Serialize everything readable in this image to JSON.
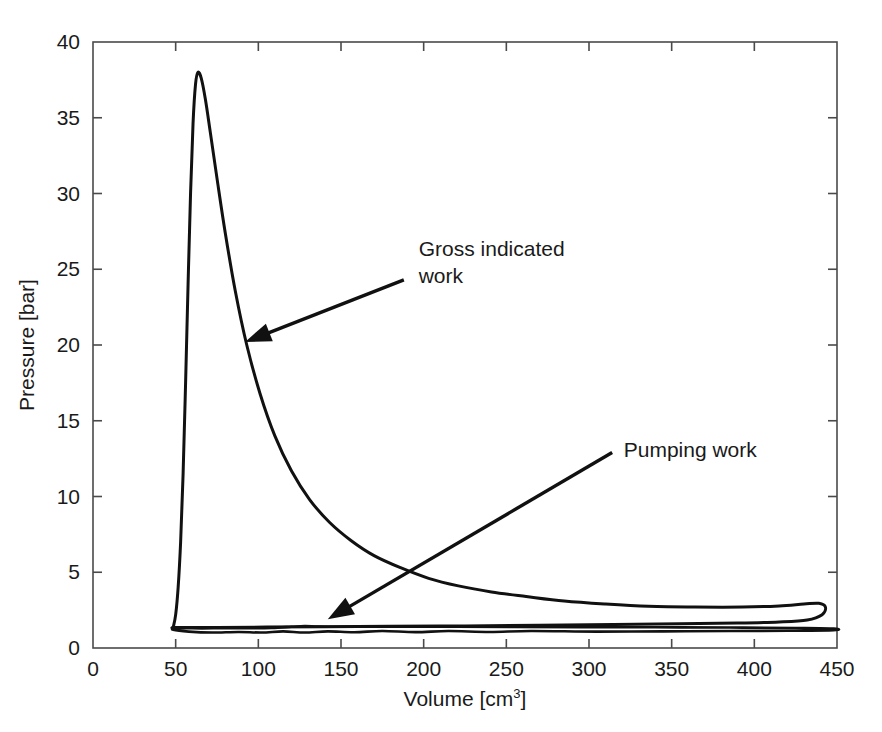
{
  "chart_data": {
    "type": "line",
    "title": "",
    "xlabel": "Volume [cm³]",
    "xlabel_base": "Volume [cm",
    "xlabel_sup": "3",
    "xlabel_tail": "]",
    "ylabel": "Pressure [bar]",
    "xlim": [
      0,
      450
    ],
    "ylim": [
      0,
      40
    ],
    "grid": false,
    "legend": "none",
    "xticks": [
      0,
      50,
      100,
      150,
      200,
      250,
      300,
      350,
      400,
      450
    ],
    "yticks": [
      0,
      5,
      10,
      15,
      20,
      25,
      30,
      35,
      40
    ],
    "xtick_labels": [
      "0",
      "50",
      "100",
      "150",
      "200",
      "250",
      "300",
      "350",
      "400",
      "450"
    ],
    "ytick_labels": [
      "0",
      "5",
      "10",
      "15",
      "20",
      "25",
      "30",
      "35",
      "40"
    ],
    "series": [
      {
        "name": "Gross indicated work loop (compression / combustion / expansion)",
        "closed": true,
        "points": [
          [
            48.5,
            1.35
          ],
          [
            50.0,
            2.2
          ],
          [
            51.5,
            4.0
          ],
          [
            53.0,
            7.0
          ],
          [
            54.5,
            11.5
          ],
          [
            56.0,
            17.5
          ],
          [
            57.5,
            24.0
          ],
          [
            59.0,
            30.0
          ],
          [
            60.5,
            34.6
          ],
          [
            62.0,
            37.2
          ],
          [
            63.5,
            38.0
          ],
          [
            65.5,
            37.6
          ],
          [
            68.0,
            36.2
          ],
          [
            71.0,
            34.0
          ],
          [
            75.0,
            31.0
          ],
          [
            80.0,
            27.4
          ],
          [
            86.0,
            23.6
          ],
          [
            93.0,
            20.0
          ],
          [
            101.0,
            16.8
          ],
          [
            110.0,
            14.0
          ],
          [
            120.0,
            11.7
          ],
          [
            131.0,
            9.8
          ],
          [
            143.0,
            8.3
          ],
          [
            156.0,
            7.1
          ],
          [
            170.0,
            6.1
          ],
          [
            186.0,
            5.3
          ],
          [
            203.0,
            4.6
          ],
          [
            221.0,
            4.1
          ],
          [
            241.0,
            3.7
          ],
          [
            262.0,
            3.4
          ],
          [
            285.0,
            3.1
          ],
          [
            310.0,
            2.9
          ],
          [
            336.0,
            2.75
          ],
          [
            364.0,
            2.7
          ],
          [
            393.0,
            2.7
          ],
          [
            415.0,
            2.78
          ],
          [
            430.0,
            2.9
          ],
          [
            439.0,
            2.95
          ],
          [
            443.0,
            2.7
          ],
          [
            441.0,
            2.2
          ],
          [
            432.0,
            1.85
          ],
          [
            415.0,
            1.72
          ],
          [
            390.0,
            1.65
          ],
          [
            355.0,
            1.6
          ],
          [
            315.0,
            1.55
          ],
          [
            270.0,
            1.5
          ],
          [
            225.0,
            1.46
          ],
          [
            180.0,
            1.43
          ],
          [
            140.0,
            1.4
          ],
          [
            105.0,
            1.38
          ],
          [
            75.0,
            1.36
          ],
          [
            55.0,
            1.35
          ],
          [
            48.5,
            1.35
          ]
        ]
      },
      {
        "name": "Pumping work loop (exhaust / intake)",
        "closed": true,
        "points": [
          [
            48.5,
            1.33
          ],
          [
            60.0,
            1.3
          ],
          [
            75.0,
            1.3
          ],
          [
            92.0,
            1.31
          ],
          [
            108.0,
            1.33
          ],
          [
            120.0,
            1.4
          ],
          [
            128.0,
            1.45
          ],
          [
            136.0,
            1.42
          ],
          [
            148.0,
            1.4
          ],
          [
            165.0,
            1.4
          ],
          [
            190.0,
            1.4
          ],
          [
            220.0,
            1.4
          ],
          [
            255.0,
            1.39
          ],
          [
            295.0,
            1.38
          ],
          [
            340.0,
            1.37
          ],
          [
            385.0,
            1.35
          ],
          [
            425.0,
            1.32
          ],
          [
            448.0,
            1.28
          ],
          [
            448.0,
            1.18
          ],
          [
            420.0,
            1.14
          ],
          [
            385.0,
            1.12
          ],
          [
            345.0,
            1.1
          ],
          [
            305.0,
            1.08
          ],
          [
            265.0,
            1.12
          ],
          [
            240.0,
            1.06
          ],
          [
            215.0,
            1.12
          ],
          [
            195.0,
            1.05
          ],
          [
            175.0,
            1.12
          ],
          [
            158.0,
            1.04
          ],
          [
            142.0,
            1.1
          ],
          [
            128.0,
            1.02
          ],
          [
            115.0,
            1.1
          ],
          [
            102.0,
            1.02
          ],
          [
            88.0,
            1.06
          ],
          [
            72.0,
            1.02
          ],
          [
            58.0,
            1.08
          ],
          [
            48.5,
            1.2
          ],
          [
            48.5,
            1.33
          ]
        ]
      }
    ],
    "annotations": [
      {
        "id": "gross-indicated-work",
        "text_line1": "Gross indicated",
        "text_line2": "work",
        "text_x": 197,
        "text_y": 25.9,
        "tail_x": 188,
        "tail_y": 24.3,
        "head_x": 92,
        "head_y": 20.2
      },
      {
        "id": "pumping-work",
        "text_line1": "Pumping work",
        "text_line2": "",
        "text_x": 321,
        "text_y": 12.6,
        "tail_x": 314,
        "tail_y": 12.9,
        "head_x": 142,
        "head_y": 1.9
      }
    ]
  },
  "colors": {
    "curve": "#111111",
    "axis": "#4a4a4a",
    "background": "#ffffff",
    "text": "#1a1a1a"
  }
}
